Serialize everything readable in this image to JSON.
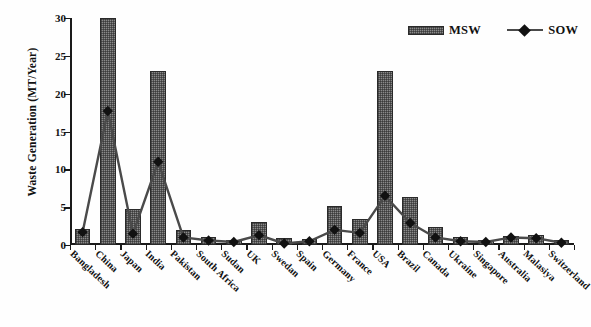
{
  "chart_data": {
    "type": "bar",
    "title": "",
    "xlabel": "",
    "ylabel": "Waste Generation (MT/Year)",
    "ylim": [
      0,
      30
    ],
    "yticks": [
      0,
      5,
      10,
      15,
      20,
      25,
      30
    ],
    "grid": false,
    "legend_position": "top-right",
    "categories": [
      "Bangladesh",
      "China",
      "Japan",
      "India",
      "Pakistan",
      "South Africa",
      "Sudan",
      "UK",
      "Swedan",
      "Spain",
      "Germany",
      "France",
      "USA",
      "Brazil",
      "Canada",
      "Ukraine",
      "Singapore",
      "Australia",
      "Malasiya",
      "Switzerland"
    ],
    "series": [
      {
        "name": "MSW",
        "render": "bar",
        "color": "#8a8a8a",
        "values": [
          2.1,
          30.0,
          4.7,
          23.0,
          2.0,
          1.0,
          0.6,
          3.0,
          0.9,
          0.8,
          5.1,
          3.5,
          23.0,
          6.3,
          2.4,
          1.0,
          0.7,
          1.2,
          1.3,
          0.6
        ]
      },
      {
        "name": "SOW",
        "render": "line-marker",
        "color": "#4a4a4a",
        "marker": "diamond",
        "values": [
          1.7,
          17.7,
          1.5,
          11.0,
          1.0,
          0.6,
          0.4,
          1.3,
          0.2,
          0.5,
          2.0,
          1.6,
          6.5,
          2.9,
          1.0,
          0.5,
          0.4,
          1.0,
          0.9,
          0.3
        ]
      }
    ]
  },
  "legend": {
    "items": [
      {
        "label": "MSW",
        "type": "bar-swatch"
      },
      {
        "label": "SOW",
        "type": "line-marker-swatch"
      }
    ]
  },
  "axes": {
    "y_title": "Waste Generation (MT/Year)"
  }
}
